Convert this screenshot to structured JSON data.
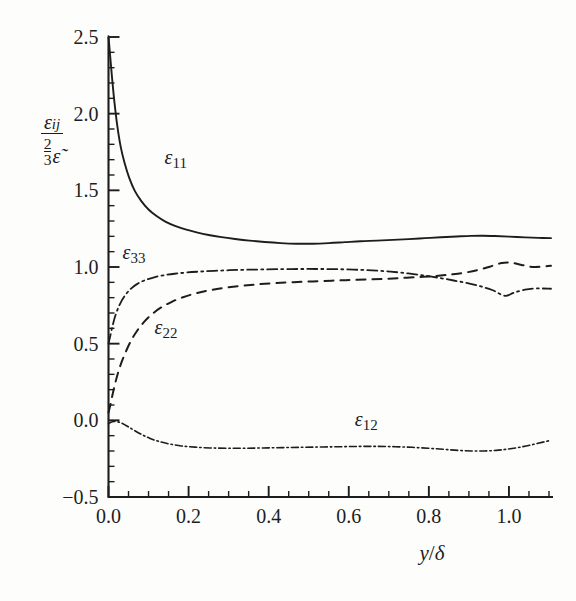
{
  "chart_data": {
    "type": "line",
    "title": "",
    "subtitle": "",
    "xlabel": "y/δ",
    "ylabel": "ε_ij / (2/3 ε̃)",
    "xlim": [
      0.0,
      1.11
    ],
    "ylim": [
      -0.5,
      2.5
    ],
    "x_major_ticks": [
      0.0,
      0.2,
      0.4,
      0.6,
      0.8,
      1.0
    ],
    "x_major_tick_labels": [
      "0.0",
      "0.2",
      "0.4",
      "0.6",
      "0.8",
      "1.0"
    ],
    "x_minor_tick_step": 0.05,
    "y_major_ticks": [
      -0.5,
      0.0,
      0.5,
      1.0,
      1.5,
      2.0,
      2.5
    ],
    "y_major_tick_labels": [
      "-0.5",
      "0.0",
      "0.5",
      "1.0",
      "1.5",
      "2.0",
      "2.5"
    ],
    "y_minor_tick_step": 0.1,
    "grid": false,
    "legend_position": "inline-annotations",
    "series": [
      {
        "name": "ε_11",
        "label": "ε",
        "label_sub": "11",
        "style": "solid",
        "label_x": 0.14,
        "label_y": 1.67,
        "x": [
          0.0,
          0.004,
          0.009,
          0.015,
          0.022,
          0.03,
          0.04,
          0.052,
          0.066,
          0.082,
          0.1,
          0.12,
          0.142,
          0.166,
          0.192,
          0.22,
          0.25,
          0.282,
          0.316,
          0.352,
          0.39,
          0.43,
          0.47,
          0.51,
          0.55,
          0.59,
          0.63,
          0.67,
          0.71,
          0.75,
          0.79,
          0.83,
          0.87,
          0.905,
          0.935,
          0.965,
          1.0,
          1.04,
          1.075,
          1.105
        ],
        "y": [
          2.505,
          2.38,
          2.23,
          2.07,
          1.92,
          1.79,
          1.68,
          1.58,
          1.495,
          1.43,
          1.375,
          1.332,
          1.296,
          1.268,
          1.245,
          1.226,
          1.209,
          1.195,
          1.183,
          1.172,
          1.163,
          1.156,
          1.152,
          1.152,
          1.156,
          1.162,
          1.168,
          1.172,
          1.177,
          1.182,
          1.188,
          1.194,
          1.199,
          1.203,
          1.204,
          1.202,
          1.198,
          1.193,
          1.19,
          1.188
        ]
      },
      {
        "name": "ε_33",
        "label": "ε",
        "label_sub": "33",
        "style": "dashdot",
        "label_x": 0.035,
        "label_y": 1.05,
        "x": [
          0.0,
          0.004,
          0.01,
          0.018,
          0.028,
          0.04,
          0.055,
          0.072,
          0.092,
          0.114,
          0.138,
          0.165,
          0.195,
          0.228,
          0.264,
          0.302,
          0.342,
          0.384,
          0.428,
          0.474,
          0.52,
          0.566,
          0.612,
          0.658,
          0.704,
          0.748,
          0.79,
          0.828,
          0.862,
          0.894,
          0.926,
          0.958,
          0.99,
          1.012,
          1.04,
          1.07,
          1.105
        ],
        "y": [
          0.5,
          0.545,
          0.615,
          0.69,
          0.755,
          0.81,
          0.856,
          0.89,
          0.915,
          0.933,
          0.946,
          0.956,
          0.964,
          0.97,
          0.975,
          0.979,
          0.982,
          0.984,
          0.986,
          0.987,
          0.987,
          0.986,
          0.983,
          0.978,
          0.97,
          0.958,
          0.944,
          0.928,
          0.912,
          0.896,
          0.876,
          0.85,
          0.812,
          0.832,
          0.852,
          0.86,
          0.858
        ]
      },
      {
        "name": "ε_22",
        "label": "ε",
        "label_sub": "22",
        "style": "dashed",
        "label_x": 0.115,
        "label_y": 0.565,
        "x": [
          0.0,
          0.005,
          0.012,
          0.02,
          0.03,
          0.042,
          0.056,
          0.072,
          0.09,
          0.11,
          0.132,
          0.158,
          0.186,
          0.218,
          0.252,
          0.29,
          0.33,
          0.372,
          0.416,
          0.462,
          0.51,
          0.558,
          0.606,
          0.654,
          0.7,
          0.744,
          0.786,
          0.824,
          0.858,
          0.89,
          0.922,
          0.952,
          0.982,
          1.006,
          1.034,
          1.064,
          1.105
        ],
        "y": [
          0.05,
          0.105,
          0.19,
          0.275,
          0.36,
          0.44,
          0.518,
          0.586,
          0.645,
          0.695,
          0.737,
          0.773,
          0.803,
          0.828,
          0.848,
          0.864,
          0.877,
          0.887,
          0.895,
          0.901,
          0.906,
          0.911,
          0.915,
          0.919,
          0.924,
          0.93,
          0.936,
          0.943,
          0.952,
          0.963,
          0.98,
          1.002,
          1.026,
          1.028,
          1.012,
          1.0,
          1.008
        ]
      },
      {
        "name": "ε_12",
        "label": "ε",
        "label_sub": "12",
        "style": "dashdot-fine",
        "label_x": 0.615,
        "label_y": -0.035,
        "x": [
          0.0,
          0.006,
          0.014,
          0.024,
          0.036,
          0.05,
          0.066,
          0.084,
          0.104,
          0.126,
          0.152,
          0.182,
          0.216,
          0.254,
          0.296,
          0.34,
          0.386,
          0.434,
          0.482,
          0.53,
          0.578,
          0.626,
          0.672,
          0.716,
          0.758,
          0.798,
          0.836,
          0.872,
          0.906,
          0.938,
          0.968,
          0.996,
          1.026,
          1.056,
          1.085,
          1.105
        ],
        "y": [
          -0.022,
          -0.012,
          -0.008,
          -0.01,
          -0.022,
          -0.043,
          -0.068,
          -0.094,
          -0.118,
          -0.138,
          -0.154,
          -0.167,
          -0.175,
          -0.18,
          -0.182,
          -0.182,
          -0.18,
          -0.178,
          -0.176,
          -0.174,
          -0.172,
          -0.17,
          -0.17,
          -0.172,
          -0.176,
          -0.182,
          -0.189,
          -0.196,
          -0.2,
          -0.2,
          -0.196,
          -0.188,
          -0.176,
          -0.16,
          -0.142,
          -0.13
        ]
      }
    ]
  },
  "axes": {
    "y_title_numerator": "ε",
    "y_title_numerator_sub": "ij",
    "y_title_den_frac_num": "2",
    "y_title_den_frac_den": "3",
    "y_title_den_sym": "ε̃",
    "x_title_var": "y",
    "x_title_slash": "/",
    "x_title_delta": "δ"
  },
  "colors": {
    "ink": "#1d1d1d",
    "background": "#fdfdfc"
  }
}
